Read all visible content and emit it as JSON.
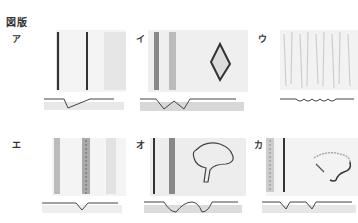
{
  "title": "図版",
  "panels": [
    {
      "label": "ア",
      "profile": "single-asymmetric-v"
    },
    {
      "label": "イ",
      "profile": "double-v"
    },
    {
      "label": "ウ",
      "profile": "fine-wave"
    },
    {
      "label": "エ",
      "profile": "single-v"
    },
    {
      "label": "オ",
      "profile": "double-rounded"
    },
    {
      "label": "カ",
      "profile": "double-notch"
    }
  ],
  "colors": {
    "ink": "#333333",
    "shade": "#cfcfcf",
    "light": "#ececec"
  }
}
